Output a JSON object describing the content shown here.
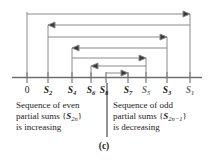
{
  "figure": {
    "panel_label": "(c)",
    "axis": {
      "ticks": [
        {
          "id": "zero",
          "label": "0",
          "sub": "",
          "x": 27,
          "italic": false,
          "faded": false
        },
        {
          "id": "s2",
          "label": "S",
          "sub": "2",
          "x": 48,
          "italic": true,
          "faded": false
        },
        {
          "id": "s4",
          "label": "S",
          "sub": "4",
          "x": 72,
          "italic": true,
          "faded": false
        },
        {
          "id": "s6",
          "label": "S",
          "sub": "6",
          "x": 91,
          "italic": true,
          "faded": false
        },
        {
          "id": "s8",
          "label": "S",
          "sub": "8",
          "x": 106,
          "italic": true,
          "faded": false
        },
        {
          "id": "s7",
          "label": "S",
          "sub": "7",
          "x": 128,
          "italic": true,
          "faded": false
        },
        {
          "id": "s5",
          "label": "S",
          "sub": "5",
          "x": 146,
          "italic": true,
          "faded": true
        },
        {
          "id": "s3",
          "label": "S",
          "sub": "3",
          "x": 167,
          "italic": true,
          "faded": false
        },
        {
          "id": "s1",
          "label": "S",
          "sub": "1",
          "x": 190,
          "italic": true,
          "faded": true
        }
      ]
    },
    "brackets": [
      {
        "id": "s1-to-s2",
        "from": 190,
        "to": 48,
        "y": 14,
        "arrow": "right",
        "stem_from_y": 14,
        "stem_to_y": 77,
        "head_x": 186
      },
      {
        "id": "s2-to-s3",
        "from": 48,
        "to": 167,
        "y": 25,
        "arrow": "left",
        "stem_from_y": 25,
        "stem_to_y": 77,
        "head_x": 52
      },
      {
        "id": "s3-to-s4",
        "from": 167,
        "to": 72,
        "y": 37,
        "arrow": "right",
        "stem_from_y": 37,
        "stem_to_y": 77,
        "head_x": 163
      },
      {
        "id": "s4-to-s5",
        "from": 72,
        "to": 146,
        "y": 48,
        "arrow": "left",
        "stem_from_y": 48,
        "stem_to_y": 77,
        "head_x": 76
      },
      {
        "id": "s5-to-s6",
        "from": 146,
        "to": 91,
        "y": 58,
        "arrow": "right",
        "stem_from_y": 58,
        "stem_to_y": 77,
        "head_x": 142
      },
      {
        "id": "s6-to-s7",
        "from": 91,
        "to": 128,
        "y": 66,
        "arrow": "left",
        "stem_from_y": 66,
        "stem_to_y": 77,
        "head_x": 95
      },
      {
        "id": "s7-to-s8",
        "from": 128,
        "to": 106,
        "y": 73,
        "arrow": "right",
        "stem_from_y": 73,
        "stem_to_y": 77,
        "head_x": 124
      }
    ],
    "captions": {
      "left": {
        "line1": "Sequence of even",
        "line2_pre": "partial sums {",
        "line2_sym": "S",
        "line2_sub": "2n",
        "line2_post": "}",
        "line3": "is increasing"
      },
      "right": {
        "line1": "Sequence of odd",
        "line2_pre": "partial sums {",
        "line2_sym": "S",
        "line2_sub": "2n−1",
        "line2_post": "}",
        "line3": "is decreasing"
      }
    },
    "colors": {
      "line": "#7a7a7a",
      "axis": "#6f6f6f",
      "text": "#1c1c1c",
      "faded_text": "#6e6e6e",
      "background": "#ffffff"
    }
  }
}
